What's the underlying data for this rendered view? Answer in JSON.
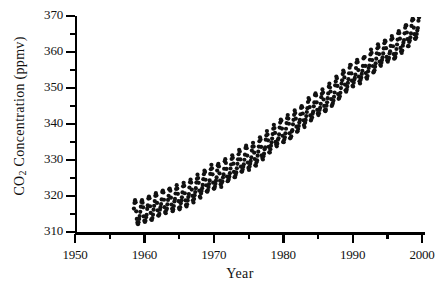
{
  "chart_data": {
    "type": "scatter",
    "title": "",
    "subtitle": "",
    "xlabel": "Year",
    "ylabel_parts": {
      "prefix": "CO",
      "sub": "2",
      "suffix": " Concentration  (ppmv)"
    },
    "ylabel": "CO2 Concentration (ppmv)",
    "xlim": [
      1950,
      2000
    ],
    "ylim": [
      310,
      370
    ],
    "x_major_ticks": [
      1950,
      1960,
      1970,
      1980,
      1990,
      2000
    ],
    "x_major_tick_labels": [
      "1950",
      "1960",
      "1970",
      "1980",
      "1990",
      "2000"
    ],
    "x_minor_ticks": [
      1955,
      1965,
      1975,
      1985,
      1995
    ],
    "y_major_ticks": [
      310,
      320,
      330,
      340,
      350,
      360,
      370
    ],
    "y_major_tick_labels": [
      "310",
      "320",
      "330",
      "340",
      "350",
      "360",
      "370"
    ],
    "y_minor_ticks": [
      315,
      325,
      335,
      345,
      355,
      365
    ],
    "grid": false,
    "legend": null,
    "annotations": [],
    "marker": {
      "shape": "circle",
      "size_px": 2.1,
      "color": "#111111"
    },
    "series": [
      {
        "name": "Monthly mean atmospheric CO2",
        "x_start": 1958.2,
        "x_end": 1999.5,
        "sampling_per_year": 12,
        "trend_model": "quadratic",
        "trend_anchor_points": [
          {
            "x": 1958.2,
            "y": 315.2
          },
          {
            "x": 1965.0,
            "y": 319.9
          },
          {
            "x": 1970.0,
            "y": 325.5
          },
          {
            "x": 1975.0,
            "y": 331.0
          },
          {
            "x": 1980.0,
            "y": 338.6
          },
          {
            "x": 1985.0,
            "y": 345.8
          },
          {
            "x": 1990.0,
            "y": 354.0
          },
          {
            "x": 1995.0,
            "y": 360.6
          },
          {
            "x": 1999.5,
            "y": 367.5
          }
        ],
        "seasonal_amplitude_ppmv": 3.1,
        "seasonal_peak_month": 5,
        "noise_ppmv": 0.35
      }
    ]
  },
  "axis": {
    "y_title_text": "CO2 Concentration  (ppmv)",
    "x_title_text": "Year"
  }
}
